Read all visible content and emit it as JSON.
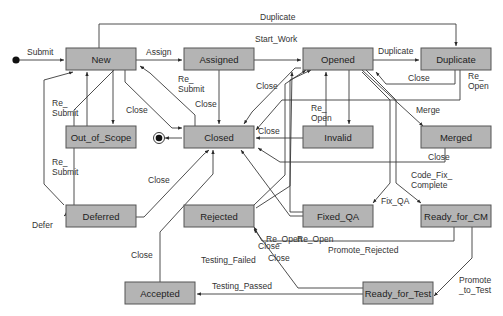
{
  "diagram": {
    "type": "state-machine",
    "initial_state": "initial",
    "final_state": "final",
    "colors": {
      "state_fill": "#b4b4b4",
      "state_border": "#555555",
      "line": "#3a3a3a",
      "text": "#222222"
    },
    "states": [
      {
        "id": "new",
        "label": "New"
      },
      {
        "id": "assigned",
        "label": "Assigned"
      },
      {
        "id": "opened",
        "label": "Opened"
      },
      {
        "id": "duplicate",
        "label": "Duplicate"
      },
      {
        "id": "out_of_scope",
        "label": "Out_of_Scope"
      },
      {
        "id": "closed",
        "label": "Closed"
      },
      {
        "id": "invalid",
        "label": "Invalid"
      },
      {
        "id": "merged",
        "label": "Merged"
      },
      {
        "id": "deferred",
        "label": "Deferred"
      },
      {
        "id": "rejected",
        "label": "Rejected"
      },
      {
        "id": "fixed_qa",
        "label": "Fixed_QA"
      },
      {
        "id": "ready_for_cm",
        "label": "Ready_for_CM"
      },
      {
        "id": "accepted",
        "label": "Accepted"
      },
      {
        "id": "ready_for_test",
        "label": "Ready_for_Test"
      }
    ],
    "transitions": [
      {
        "id": "t_submit",
        "from": "initial",
        "to": "new",
        "label": "Submit"
      },
      {
        "id": "t_assign",
        "from": "new",
        "to": "assigned",
        "label": "Assign"
      },
      {
        "id": "t_start_work",
        "from": "assigned",
        "to": "opened",
        "label": "Start_Work"
      },
      {
        "id": "t_dup_top",
        "from": "new",
        "to": "duplicate",
        "label": "Duplicate"
      },
      {
        "id": "t_dup_opened",
        "from": "opened",
        "to": "duplicate",
        "label": "Duplicate"
      },
      {
        "id": "t_dup_close",
        "from": "duplicate",
        "to": "opened",
        "label": "Close"
      },
      {
        "id": "t_dup_reopen",
        "from": "duplicate",
        "to": "closed",
        "label": "Re_\nOpen"
      },
      {
        "id": "t_new_oos",
        "from": "new",
        "to": "out_of_scope",
        "label": ""
      },
      {
        "id": "t_oos_resubmit",
        "from": "out_of_scope",
        "to": "new",
        "label": "Re_\nSubmit"
      },
      {
        "id": "t_new_close",
        "from": "new",
        "to": "closed",
        "label": "Close"
      },
      {
        "id": "t_closed_resubmit",
        "from": "closed",
        "to": "new",
        "label": "Re_\nSubmit"
      },
      {
        "id": "t_assigned_close",
        "from": "assigned",
        "to": "closed",
        "label": "Close"
      },
      {
        "id": "t_opened_close",
        "from": "opened",
        "to": "closed",
        "label": "Close"
      },
      {
        "id": "t_opened_invalid",
        "from": "opened",
        "to": "invalid",
        "label": ""
      },
      {
        "id": "t_invalid_reopen",
        "from": "invalid",
        "to": "opened",
        "label": "Re_\nOpen"
      },
      {
        "id": "t_invalid_close",
        "from": "invalid",
        "to": "closed",
        "label": "Close"
      },
      {
        "id": "t_merge",
        "from": "opened",
        "to": "merged",
        "label": "Merge"
      },
      {
        "id": "t_merged_close",
        "from": "merged",
        "to": "closed",
        "label": "Close"
      },
      {
        "id": "t_closed_final",
        "from": "closed",
        "to": "final",
        "label": ""
      },
      {
        "id": "t_defer",
        "from": "new",
        "to": "deferred",
        "label": "Defer"
      },
      {
        "id": "t_deferred_resubmit",
        "from": "deferred",
        "to": "new",
        "label": "Re_\nSubmit"
      },
      {
        "id": "t_deferred_close",
        "from": "deferred",
        "to": "closed",
        "label": "Close"
      },
      {
        "id": "t_rejected_reopen",
        "from": "rejected",
        "to": "opened",
        "label": "Re_Open"
      },
      {
        "id": "t_rejected_close",
        "from": "rejected",
        "to": "closed",
        "label": "Close"
      },
      {
        "id": "t_fixedqa_reopen",
        "from": "fixed_qa",
        "to": "opened",
        "label": "Re_Open"
      },
      {
        "id": "t_fixedqa_close",
        "from": "fixed_qa",
        "to": "closed",
        "label": "Close"
      },
      {
        "id": "t_fix_qa",
        "from": "opened",
        "to": "fixed_qa",
        "label": "Fix_QA"
      },
      {
        "id": "t_code_fix",
        "from": "opened",
        "to": "ready_for_cm",
        "label": "Code_Fix_\nComplete"
      },
      {
        "id": "t_promote_rejected",
        "from": "ready_for_cm",
        "to": "rejected",
        "label": "Promote_Rejected"
      },
      {
        "id": "t_promote_to_test",
        "from": "ready_for_cm",
        "to": "ready_for_test",
        "label": "Promote\n_to_Test"
      },
      {
        "id": "t_testing_failed",
        "from": "ready_for_test",
        "to": "rejected",
        "label": "Testing_Failed"
      },
      {
        "id": "t_testing_passed",
        "from": "ready_for_test",
        "to": "accepted",
        "label": "Testing_Passed"
      },
      {
        "id": "t_accepted_close",
        "from": "accepted",
        "to": "closed",
        "label": "Close"
      }
    ]
  }
}
